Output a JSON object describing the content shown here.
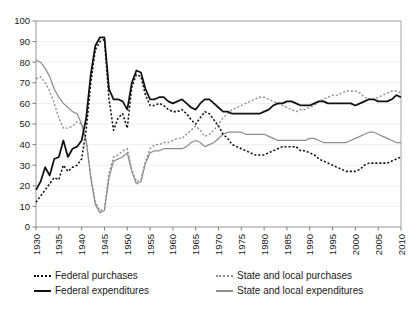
{
  "chart_title": "",
  "legend": {
    "position": "bottom",
    "entries": [
      {
        "label": "Federal purchases",
        "style": "dotted",
        "color": "#111111",
        "swatch": "sw-dot-black"
      },
      {
        "label": "Federal expenditures",
        "style": "solid",
        "color": "#111111",
        "swatch": "sw-solid-black"
      },
      {
        "label": "State and local purchases",
        "style": "dotted",
        "color": "#8d8d8d",
        "swatch": "sw-dot-gray"
      },
      {
        "label": "State and local expenditures",
        "style": "solid",
        "color": "#8d8d8d",
        "swatch": "sw-solid-gray"
      }
    ]
  },
  "chart_data": {
    "type": "line",
    "title": "",
    "xlabel": "",
    "ylabel": "",
    "xlim": [
      1930,
      2010
    ],
    "ylim": [
      0,
      100
    ],
    "xtick_step": 5,
    "ytick_step": 10,
    "grid": true,
    "legend_position": "bottom",
    "ytick_labels": [
      "0",
      "10",
      "20",
      "30",
      "40",
      "50",
      "60",
      "70",
      "80",
      "90",
      "100"
    ],
    "xtick_labels": [
      "1930",
      "1935",
      "1940",
      "1945",
      "1950",
      "1955",
      "1960",
      "1965",
      "1970",
      "1975",
      "1980",
      "1985",
      "1990",
      "1995",
      "2000",
      "2005",
      "2010"
    ],
    "x": [
      1930,
      1931,
      1932,
      1933,
      1934,
      1935,
      1936,
      1937,
      1938,
      1939,
      1940,
      1941,
      1942,
      1943,
      1944,
      1945,
      1946,
      1947,
      1948,
      1949,
      1950,
      1951,
      1952,
      1953,
      1954,
      1955,
      1956,
      1957,
      1958,
      1959,
      1960,
      1961,
      1962,
      1963,
      1964,
      1965,
      1966,
      1967,
      1968,
      1969,
      1970,
      1971,
      1972,
      1973,
      1974,
      1975,
      1976,
      1977,
      1978,
      1979,
      1980,
      1981,
      1982,
      1983,
      1984,
      1985,
      1986,
      1987,
      1988,
      1989,
      1990,
      1991,
      1992,
      1993,
      1994,
      1995,
      1996,
      1997,
      1998,
      1999,
      2000,
      2001,
      2002,
      2003,
      2004,
      2005,
      2006,
      2007,
      2008,
      2009,
      2010
    ],
    "series": [
      {
        "name": "Federal purchases",
        "color": "#111111",
        "style": "dotted",
        "values": [
          12,
          15,
          18,
          21,
          24,
          23,
          30,
          27,
          29,
          30,
          33,
          47,
          70,
          86,
          90,
          91,
          62,
          47,
          53,
          55,
          48,
          68,
          74,
          73,
          64,
          59,
          59,
          60,
          59,
          57,
          56,
          56,
          57,
          55,
          52,
          50,
          53,
          56,
          55,
          52,
          49,
          45,
          43,
          40,
          39,
          38,
          37,
          36,
          35,
          35,
          35,
          36,
          37,
          38,
          39,
          39,
          39,
          39,
          37,
          37,
          36,
          35,
          33,
          32,
          31,
          30,
          29,
          28,
          27,
          27,
          27,
          28,
          30,
          31,
          31,
          31,
          31,
          31,
          32,
          33,
          34
        ]
      },
      {
        "name": "Federal expenditures",
        "color": "#111111",
        "style": "solid",
        "values": [
          18,
          22,
          29,
          25,
          33,
          34,
          42,
          34,
          38,
          39,
          42,
          53,
          74,
          88,
          92,
          92,
          67,
          62,
          62,
          61,
          57,
          70,
          76,
          75,
          67,
          62,
          62,
          63,
          63,
          61,
          60,
          61,
          62,
          60,
          58,
          57,
          60,
          62,
          62,
          60,
          58,
          56,
          56,
          55,
          55,
          55,
          55,
          55,
          55,
          55,
          56,
          57,
          59,
          60,
          60,
          61,
          61,
          60,
          59,
          59,
          59,
          60,
          61,
          61,
          60,
          60,
          60,
          60,
          60,
          60,
          59,
          60,
          61,
          62,
          62,
          61,
          61,
          61,
          62,
          64,
          63
        ]
      },
      {
        "name": "State and local purchases",
        "color": "#8d8d8d",
        "style": "dotted",
        "values": [
          72,
          73,
          70,
          66,
          60,
          53,
          48,
          48,
          49,
          51,
          50,
          42,
          25,
          12,
          8,
          9,
          26,
          34,
          35,
          37,
          38,
          28,
          22,
          23,
          32,
          38,
          40,
          40,
          41,
          41,
          42,
          43,
          43,
          45,
          47,
          49,
          47,
          44,
          45,
          47,
          50,
          53,
          55,
          57,
          58,
          59,
          60,
          61,
          62,
          63,
          63,
          62,
          61,
          60,
          59,
          58,
          57,
          56,
          57,
          57,
          58,
          59,
          61,
          62,
          63,
          64,
          64,
          65,
          66,
          66,
          66,
          65,
          63,
          62,
          62,
          63,
          64,
          65,
          66,
          66,
          65
        ]
      },
      {
        "name": "State and local expenditures",
        "color": "#8d8d8d",
        "style": "solid",
        "values": [
          81,
          80,
          77,
          73,
          67,
          63,
          60,
          58,
          56,
          55,
          50,
          42,
          24,
          11,
          7,
          8,
          24,
          32,
          33,
          34,
          36,
          27,
          21,
          22,
          31,
          36,
          37,
          37,
          38,
          38,
          38,
          38,
          38,
          39,
          41,
          42,
          41,
          39,
          40,
          41,
          43,
          45,
          46,
          46,
          46,
          46,
          45,
          45,
          45,
          45,
          45,
          44,
          43,
          42,
          42,
          42,
          42,
          42,
          42,
          42,
          43,
          43,
          42,
          41,
          41,
          41,
          41,
          41,
          41,
          42,
          43,
          44,
          45,
          46,
          46,
          45,
          44,
          43,
          42,
          41,
          41
        ]
      }
    ]
  }
}
